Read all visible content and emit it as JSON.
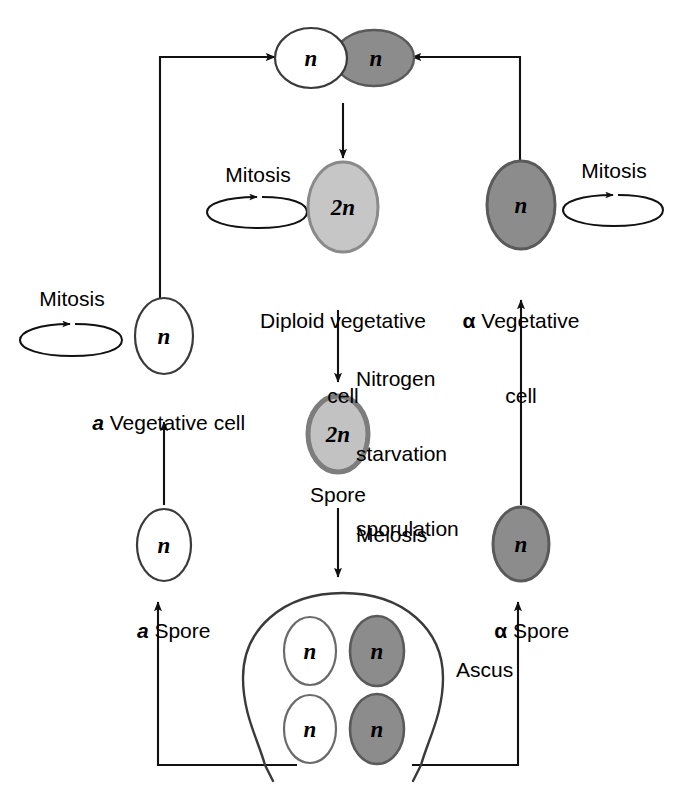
{
  "diagram": {
    "colors": {
      "white_cell_fill": "#ffffff",
      "white_cell_stroke": "#3a3a3a",
      "alpha_cell_fill": "#8c8c8c",
      "alpha_cell_stroke": "#5a5a5a",
      "diploid_cell_fill": "#c6c6c6",
      "diploid_cell_stroke": "#8a8a8a",
      "spore_2n_fill": "#c2c2c2",
      "spore_2n_stroke": "#7d7d7d",
      "line": "#111111",
      "text": "#000000"
    },
    "cells": {
      "zygote_left_label": "n",
      "zygote_right_label": "n",
      "diploid_vegetative_label": "2n",
      "alpha_vegetative_label": "n",
      "a_vegetative_label": "n",
      "spore_diploid_label": "2n",
      "a_spore_label": "n",
      "alpha_spore_label": "n",
      "ascus_spore_1_label": "n",
      "ascus_spore_2_label": "n",
      "ascus_spore_3_label": "n",
      "ascus_spore_4_label": "n"
    },
    "labels": {
      "mitosis_left": "Mitosis",
      "mitosis_center": "Mitosis",
      "mitosis_right": "Mitosis",
      "diploid_vegetative_cell_line1": "Diploid vegetative",
      "diploid_vegetative_cell_line2": "cell",
      "alpha_vegetative_cell_prefix": "α",
      "alpha_vegetative_cell_line1": " Vegetative",
      "alpha_vegetative_cell_line2": "cell",
      "a_vegetative_cell_prefix": "a",
      "a_vegetative_cell_rest": " Vegetative cell",
      "nitrogen_starvation_line1": "Nitrogen",
      "nitrogen_starvation_line2": "starvation",
      "nitrogen_starvation_line3": "sporulation",
      "spore": "Spore",
      "meiosis": "Meiosis",
      "a_spore_prefix": "a",
      "a_spore_rest": " Spore",
      "alpha_spore_prefix": "α",
      "alpha_spore_rest": " Spore",
      "ascus": "Ascus"
    }
  }
}
